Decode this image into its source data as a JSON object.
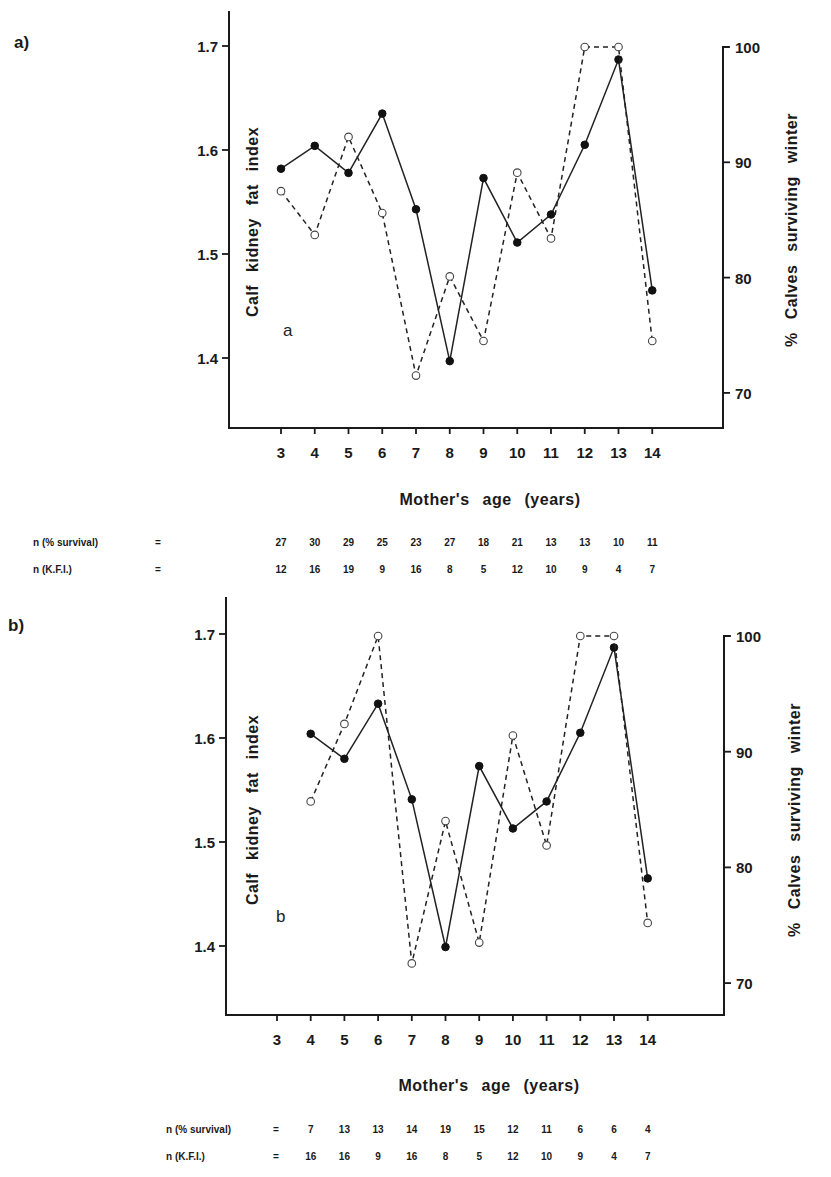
{
  "chart_data": [
    {
      "panel": "a)",
      "inner_label": "a",
      "type": "line",
      "xlabel": "Mother's  age  (years)",
      "ylabel_left": "Calf  kidney  fat  index",
      "ylabel_right": "%  Calves  surviving  winter",
      "x_ticks": [
        "3",
        "4",
        "5",
        "6",
        "7",
        "8",
        "9",
        "10",
        "11",
        "12",
        "13",
        "14"
      ],
      "y_left_ticks": [
        "1.7",
        "1.6",
        "1.5",
        "1.4"
      ],
      "y_right_ticks": [
        "100",
        "90",
        "80",
        "70"
      ],
      "ylim_left": [
        1.33,
        1.73
      ],
      "ylim_right": [
        66.9,
        103.5
      ],
      "x": [
        3,
        4,
        5,
        6,
        7,
        8,
        9,
        10,
        11,
        12,
        13,
        14
      ],
      "series": [
        {
          "name": "Calf kidney fat index",
          "axis": "left",
          "style": "solid, filled circles",
          "values": [
            1.582,
            1.604,
            1.578,
            1.635,
            1.543,
            1.397,
            1.573,
            1.511,
            1.538,
            1.605,
            1.687,
            1.465
          ]
        },
        {
          "name": "% Calves surviving winter",
          "axis": "right",
          "style": "dashed, open circles",
          "values": [
            87.5,
            83.7,
            92.2,
            85.6,
            71.5,
            80.1,
            74.5,
            89.1,
            83.4,
            100,
            100,
            74.5
          ]
        }
      ],
      "n_rows": [
        {
          "label": "n  (% survival)",
          "eq": "=",
          "values": [
            "27",
            "30",
            "29",
            "25",
            "23",
            "27",
            "18",
            "21",
            "13",
            "13",
            "10",
            "11"
          ]
        },
        {
          "label": "n  (K.F.I.)",
          "eq": "=",
          "values": [
            "12",
            "16",
            "19",
            "9",
            "16",
            "8",
            "5",
            "12",
            "10",
            "9",
            "4",
            "7"
          ]
        }
      ]
    },
    {
      "panel": "b)",
      "inner_label": "b",
      "type": "line",
      "xlabel": "Mother's  age  (years)",
      "ylabel_left": "Calf  kidney  fat  index",
      "ylabel_right": "%  Calves  surviving  winter",
      "x_ticks": [
        "3",
        "4",
        "5",
        "6",
        "7",
        "8",
        "9",
        "10",
        "11",
        "12",
        "13",
        "14"
      ],
      "y_left_ticks": [
        "1.7",
        "1.6",
        "1.5",
        "1.4"
      ],
      "y_right_ticks": [
        "100",
        "90",
        "80",
        "70"
      ],
      "ylim_left": [
        1.33,
        1.74
      ],
      "ylim_right": [
        66.9,
        103.2
      ],
      "x": [
        4,
        5,
        6,
        7,
        8,
        9,
        10,
        11,
        12,
        13,
        14
      ],
      "series": [
        {
          "name": "Calf kidney fat index",
          "axis": "left",
          "style": "solid, filled circles",
          "values": [
            1.604,
            1.58,
            1.633,
            1.541,
            1.399,
            1.573,
            1.513,
            1.539,
            1.605,
            1.687,
            1.465
          ]
        },
        {
          "name": "% Calves surviving winter",
          "axis": "right",
          "style": "dashed, open circles",
          "values": [
            85.7,
            92.4,
            100,
            71.7,
            84.0,
            73.5,
            91.4,
            81.9,
            100,
            100,
            75.2
          ]
        }
      ],
      "n_rows": [
        {
          "label": "n  (% survival)",
          "eq": "=",
          "values": [
            "7",
            "13",
            "13",
            "14",
            "19",
            "15",
            "12",
            "11",
            "6",
            "6",
            "4"
          ]
        },
        {
          "label": "n  (K.F.I.)",
          "eq": "=",
          "values": [
            "16",
            "16",
            "9",
            "16",
            "8",
            "5",
            "12",
            "10",
            "9",
            "4",
            "7"
          ]
        }
      ]
    }
  ],
  "layout": [
    {
      "top": 0,
      "axisLeftX": 229,
      "axisRightX": 723,
      "axisTopY": 11,
      "rightTopY": 47,
      "axisBottomY": 428,
      "x3": 281,
      "xStep": 33.75,
      "left17Y": 46,
      "pxPer01": 104,
      "right100Y": 47,
      "pxPerPct": 11.53,
      "panelLabel": [
        14,
        48
      ],
      "innerLabel": [
        283,
        336
      ],
      "xlabelY": 505,
      "nRow1Y": 546,
      "nRow2Y": 573,
      "nLabelX": 33,
      "nEqX": 155,
      "nStartX": 277,
      "leftLabelPos": [
        258,
        222
      ],
      "rightLabelPos": [
        797,
        230
      ]
    },
    {
      "top": 0,
      "axisLeftX": 226,
      "axisRightX": 724,
      "axisTopY": 597,
      "rightTopY": 636,
      "axisBottomY": 1015,
      "x3": 277,
      "xStep": 33.7,
      "left17Y": 634,
      "pxPer01": 104,
      "right100Y": 636,
      "pxPerPct": 11.57,
      "panelLabel": [
        8,
        631
      ],
      "innerLabel": [
        276,
        922
      ],
      "xlabelY": 1091,
      "nRow1Y": 1133,
      "nRow2Y": 1160,
      "nLabelX": 166,
      "nEqX": 273,
      "nStartX": 301,
      "leftLabelPos": [
        258,
        810
      ],
      "rightLabelPos": [
        800,
        820
      ]
    }
  ]
}
